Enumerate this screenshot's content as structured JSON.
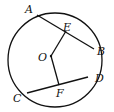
{
  "diagram": {
    "type": "circle-geometry",
    "circle": {
      "center_label": "O",
      "cx": 55,
      "cy": 60,
      "r": 47
    },
    "points": {
      "A": {
        "label": "A",
        "x": 37,
        "y": 15,
        "lx": 25,
        "ly": 13
      },
      "B": {
        "label": "B",
        "x": 94,
        "y": 49,
        "lx": 97,
        "ly": 55
      },
      "C": {
        "label": "C",
        "x": 27,
        "y": 93,
        "lx": 13,
        "ly": 102
      },
      "D": {
        "label": "D",
        "x": 88,
        "y": 77,
        "lx": 95,
        "ly": 82
      },
      "E": {
        "label": "E",
        "x": 66,
        "y": 31,
        "lx": 64,
        "ly": 31
      },
      "F": {
        "label": "F",
        "x": 59,
        "y": 85,
        "lx": 57,
        "ly": 97
      },
      "O": {
        "label": "O",
        "x": 51,
        "y": 56,
        "lx": 38,
        "ly": 61
      }
    },
    "segments": [
      [
        "A",
        "B"
      ],
      [
        "C",
        "D"
      ],
      [
        "O",
        "E"
      ],
      [
        "O",
        "F"
      ]
    ]
  }
}
